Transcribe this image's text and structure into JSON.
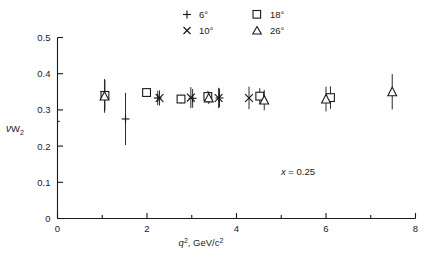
{
  "chart_data": {
    "type": "scatter",
    "title": "",
    "xlabel": "q2, GeV/c2",
    "xlabel_parts": {
      "sym": "q",
      "sup": "2",
      "rest": ", GeV/c",
      "rest_sup": "2"
    },
    "ylabel": "vW2",
    "ylabel_parts": {
      "nu": "ν",
      "w": "W",
      "sub": "2"
    },
    "xlim": [
      0,
      8
    ],
    "ylim": [
      0,
      0.5
    ],
    "xticks": [
      0,
      1,
      2,
      3,
      4,
      5,
      6,
      7,
      8
    ],
    "xticklabels": [
      "0",
      "",
      "2",
      "",
      "4",
      "",
      "6",
      "",
      "8"
    ],
    "yticks": [
      0,
      0.1,
      0.2,
      0.3,
      0.4,
      0.5
    ],
    "yticklabels": [
      "0",
      "0.1",
      "0.2",
      "0.3",
      "0.4",
      "0.5"
    ],
    "grid": false,
    "legend_position": "above-plot",
    "annotations": [
      {
        "text_x": "x",
        "text_eq": "= 0.25",
        "x": 5.2,
        "y": 0.135
      }
    ],
    "series": [
      {
        "name": "6°",
        "marker": "plus",
        "points": [
          {
            "x": 1.52,
            "y": 0.275,
            "yerr": 0.072
          },
          {
            "x": 2.24,
            "y": 0.333,
            "yerr": 0.02
          },
          {
            "x": 3.02,
            "y": 0.332,
            "yerr": 0.026
          },
          {
            "x": 3.62,
            "y": 0.333,
            "yerr": 0.026
          }
        ]
      },
      {
        "name": "10°",
        "marker": "cross",
        "points": [
          {
            "x": 1.05,
            "y": 0.341,
            "yerr": 0.044
          },
          {
            "x": 2.28,
            "y": 0.333,
            "yerr": 0.021
          },
          {
            "x": 2.98,
            "y": 0.334,
            "yerr": 0.029
          },
          {
            "x": 3.6,
            "y": 0.333,
            "yerr": 0.028
          },
          {
            "x": 4.28,
            "y": 0.333,
            "yerr": 0.031
          }
        ]
      },
      {
        "name": "18°",
        "marker": "square",
        "points": [
          {
            "x": 1.06,
            "y": 0.34,
            "yerr": 0.042
          },
          {
            "x": 1.99,
            "y": 0.348,
            "yerr": 0.012
          },
          {
            "x": 2.76,
            "y": 0.33,
            "yerr": 0.012
          },
          {
            "x": 3.36,
            "y": 0.337,
            "yerr": 0.016
          },
          {
            "x": 4.52,
            "y": 0.338,
            "yerr": 0.022
          },
          {
            "x": 6.1,
            "y": 0.334,
            "yerr": 0.031
          }
        ]
      },
      {
        "name": "26°",
        "marker": "triangle",
        "points": [
          {
            "x": 1.05,
            "y": 0.338,
            "yerr": 0.046
          },
          {
            "x": 3.38,
            "y": 0.333,
            "yerr": 0.017
          },
          {
            "x": 4.62,
            "y": 0.327,
            "yerr": 0.028
          },
          {
            "x": 6.0,
            "y": 0.33,
            "yerr": 0.034
          },
          {
            "x": 7.48,
            "y": 0.35,
            "yerr": 0.049
          }
        ]
      }
    ]
  },
  "legend": {
    "entries": [
      {
        "marker": "plus",
        "label": "6°"
      },
      {
        "marker": "square",
        "label": "18°"
      },
      {
        "marker": "cross",
        "label": "10°"
      },
      {
        "marker": "triangle",
        "label": "26°"
      }
    ]
  }
}
